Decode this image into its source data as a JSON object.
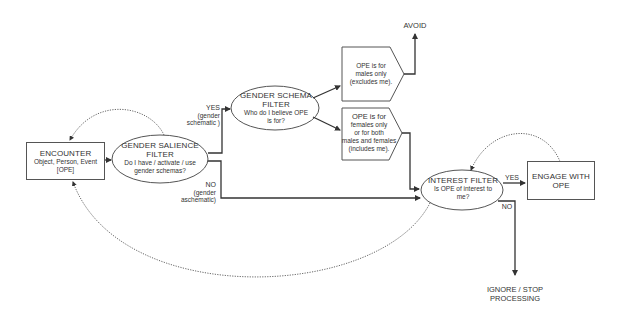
{
  "diagram": {
    "type": "flowchart",
    "nodes": {
      "encounter": {
        "title": "ENCOUNTER",
        "sub_line1": "Object, Person, Event",
        "sub_line2": "[OPE]",
        "shape": "rectangle"
      },
      "gender_salience": {
        "title_line1": "GENDER SALIENCE",
        "title_line2": "FILTER",
        "sub_line1": "Do I have / activate / use",
        "sub_line2": "gender schemas?",
        "shape": "ellipse"
      },
      "gender_schema": {
        "title_line1": "GENDER  SCHEMA",
        "title_line2": "FILTER",
        "sub_line1": "Who do I believe OPE",
        "sub_line2": "is for?",
        "shape": "ellipse"
      },
      "males_only": {
        "line1": "OPE is for",
        "line2": "males only",
        "line3": "(excludes me).",
        "shape": "hexagon"
      },
      "females_or_both": {
        "line1": "OPE is for",
        "line2": "females only",
        "line3": "or for both",
        "line4": "males and females",
        "line5": "(includes me).",
        "shape": "hexagon"
      },
      "avoid": {
        "label": "AVOID",
        "shape": "text"
      },
      "interest_filter": {
        "title": "INTEREST FILTER",
        "sub_line1": "Is OPE of interest to",
        "sub_line2": "me?",
        "shape": "ellipse"
      },
      "engage": {
        "line1": "ENGAGE WITH",
        "line2": "OPE",
        "shape": "rectangle"
      },
      "ignore": {
        "line1": "IGNORE / STOP",
        "line2": "PROCESSING",
        "shape": "text"
      }
    },
    "edge_labels": {
      "yes_schematic": {
        "line1": "YES",
        "line2": "(gender",
        "line3": "schematic )"
      },
      "no_aschematic": {
        "line1": "NO",
        "line2": "(gender",
        "line3": "aschematic)"
      },
      "interest_yes": "YES",
      "interest_no": "NO"
    },
    "edges": [
      {
        "from": "encounter",
        "to": "gender_salience",
        "style": "solid"
      },
      {
        "from": "gender_salience",
        "to": "gender_schema",
        "label": "YES (gender schematic)",
        "style": "solid"
      },
      {
        "from": "gender_salience",
        "to": "interest_filter",
        "label": "NO (gender aschematic)",
        "style": "solid"
      },
      {
        "from": "gender_schema",
        "to": "males_only",
        "style": "solid"
      },
      {
        "from": "gender_schema",
        "to": "females_or_both",
        "style": "solid"
      },
      {
        "from": "males_only",
        "to": "avoid",
        "style": "solid"
      },
      {
        "from": "females_or_both",
        "to": "interest_filter",
        "style": "solid"
      },
      {
        "from": "interest_filter",
        "to": "engage",
        "label": "YES",
        "style": "solid"
      },
      {
        "from": "interest_filter",
        "to": "ignore",
        "label": "NO",
        "style": "solid"
      },
      {
        "from": "gender_salience",
        "to": "encounter",
        "style": "dotted"
      },
      {
        "from": "interest_filter",
        "to": "encounter",
        "style": "dotted"
      },
      {
        "from": "engage",
        "to": "interest_filter",
        "style": "dotted"
      }
    ],
    "colors": {
      "stroke": "#444444",
      "text": "#333333",
      "background": "#ffffff"
    }
  }
}
